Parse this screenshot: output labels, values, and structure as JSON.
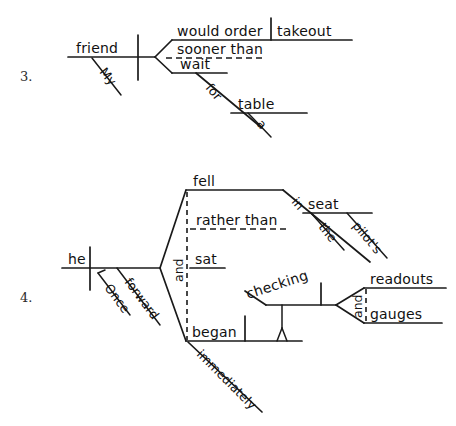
{
  "page": {
    "background_color": "#ffffff",
    "ink_color": "#111111",
    "width": 456,
    "height": 426
  },
  "exercises": [
    {
      "number": "3.",
      "sentence": "My friend would order takeout sooner than wait for a table.",
      "nodes": {
        "subject": "friend",
        "subject_modifier": "My",
        "verb": "would order",
        "direct_object": "takeout",
        "conjunction": "sooner than",
        "second_verb": "wait",
        "preposition": "for",
        "prep_object": "table",
        "prep_object_modifier": "a"
      }
    },
    {
      "number": "4.",
      "sentence": "Once he fell forward in the pilot's seat rather than sat, he began immediately checking readouts and gauges.",
      "nodes": {
        "subject": "he",
        "subordinator": "Once",
        "adverb_forward": "forward",
        "verb_one": "fell",
        "conjunction_rather_than": "rather than",
        "verb_alt": "sat",
        "conjunction_and": "and",
        "verb_two": "began",
        "adverb_immediately": "immediately",
        "preposition_in": "in",
        "prep_object_seat": "seat",
        "seat_modifier_the": "the",
        "seat_modifier_pilots": "pilot's",
        "gerund": "checking",
        "gerund_object_one": "readouts",
        "gerund_conjunction": "and",
        "gerund_object_two": "gauges"
      }
    }
  ]
}
